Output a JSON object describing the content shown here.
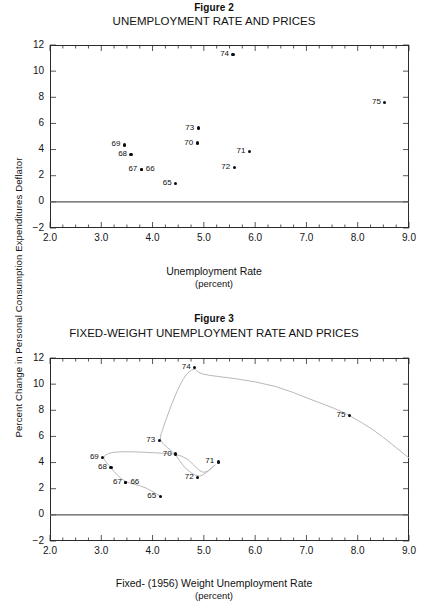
{
  "page": {
    "yaxis_shared_label": "Percent Change in  Personal Consumption  Expenditures Deflator"
  },
  "figure2": {
    "figure_label": "Figure 2",
    "title": "UNEMPLOYMENT  RATE  AND  PRICES",
    "xaxis_title": "Unemployment Rate",
    "xaxis_units": "(percent)",
    "ytick_labels": [
      "12",
      "10",
      "8",
      "6",
      "4",
      "2",
      "0",
      "−2"
    ],
    "xtick_labels": [
      "2.0",
      "3.0",
      "4.0",
      "5.0",
      "6.0",
      "7.0",
      "8.0",
      "9.0"
    ]
  },
  "figure3": {
    "figure_label": "Figure 3",
    "title": "FIXED-WEIGHT  UNEMPLOYMENT  RATE  AND  PRICES",
    "xaxis_title": "Fixed- (1956) Weight Unemployment Rate",
    "xaxis_units": "(percent)",
    "ytick_labels": [
      "12",
      "10",
      "8",
      "6",
      "4",
      "2",
      "0",
      "−2"
    ],
    "xtick_labels": [
      "2.0",
      "3.0",
      "4.0",
      "5.0",
      "6.0",
      "7.0",
      "8.0",
      "9.0"
    ]
  },
  "chart_data": [
    {
      "type": "scatter",
      "title": "UNEMPLOYMENT  RATE  AND  PRICES",
      "subtitle": "Figure 2",
      "xlabel": "Unemployment Rate (percent)",
      "ylabel": "Percent Change in Personal Consumption Expenditures Deflator",
      "xlim": [
        2.0,
        9.0
      ],
      "ylim": [
        -2,
        12
      ],
      "xticks": [
        2.0,
        3.0,
        4.0,
        5.0,
        6.0,
        7.0,
        8.0,
        9.0
      ],
      "yticks": [
        -2,
        0,
        2,
        4,
        6,
        8,
        10,
        12
      ],
      "grid": false,
      "legend": "none",
      "zero_line": true,
      "connected": false,
      "points": [
        {
          "label": "65",
          "label_side": "left",
          "x": 4.45,
          "y": 1.4
        },
        {
          "label": "66",
          "label_side": "right",
          "x": 3.78,
          "y": 2.5
        },
        {
          "label": "67",
          "label_side": "left",
          "x": 3.78,
          "y": 2.5
        },
        {
          "label": "68",
          "label_side": "left",
          "x": 3.58,
          "y": 3.6
        },
        {
          "label": "69",
          "label_side": "left",
          "x": 3.45,
          "y": 4.35
        },
        {
          "label": "70",
          "label_side": "left",
          "x": 4.87,
          "y": 4.5
        },
        {
          "label": "71",
          "label_side": "left",
          "x": 5.89,
          "y": 3.85
        },
        {
          "label": "72",
          "label_side": "left",
          "x": 5.59,
          "y": 2.6
        },
        {
          "label": "73",
          "label_side": "left",
          "x": 4.89,
          "y": 5.65
        },
        {
          "label": "74",
          "label_side": "left",
          "x": 5.57,
          "y": 11.3
        },
        {
          "label": "75",
          "label_side": "left",
          "x": 8.53,
          "y": 7.6
        }
      ]
    },
    {
      "type": "scatter",
      "title": "FIXED-WEIGHT  UNEMPLOYMENT  RATE  AND  PRICES",
      "subtitle": "Figure 3",
      "xlabel": "Fixed- (1956) Weight Unemployment Rate (percent)",
      "ylabel": "Percent Change in Personal Consumption Expenditures Deflator",
      "xlim": [
        2.0,
        9.0
      ],
      "ylim": [
        -2,
        12
      ],
      "xticks": [
        2.0,
        3.0,
        4.0,
        5.0,
        6.0,
        7.0,
        8.0,
        9.0
      ],
      "yticks": [
        -2,
        0,
        2,
        4,
        6,
        8,
        10,
        12
      ],
      "grid": false,
      "legend": "none",
      "zero_line": true,
      "connected": true,
      "points": [
        {
          "label": "65",
          "label_side": "left",
          "x": 4.15,
          "y": 1.4
        },
        {
          "label": "66",
          "label_side": "right",
          "x": 3.48,
          "y": 2.5
        },
        {
          "label": "67",
          "label_side": "left",
          "x": 3.48,
          "y": 2.5
        },
        {
          "label": "68",
          "label_side": "left",
          "x": 3.19,
          "y": 3.6
        },
        {
          "label": "69",
          "label_side": "left",
          "x": 3.03,
          "y": 4.4
        },
        {
          "label": "70",
          "label_side": "left",
          "x": 4.45,
          "y": 4.65
        },
        {
          "label": "71",
          "label_side": "left",
          "x": 5.28,
          "y": 4.05
        },
        {
          "label": "72",
          "label_side": "left",
          "x": 4.88,
          "y": 2.85
        },
        {
          "label": "73",
          "label_side": "left",
          "x": 4.13,
          "y": 5.7
        },
        {
          "label": "74",
          "label_side": "left",
          "x": 4.82,
          "y": 11.3
        },
        {
          "label": "75",
          "label_side": "left",
          "x": 7.84,
          "y": 7.6
        }
      ],
      "trace_path": [
        [
          4.15,
          1.4
        ],
        [
          3.9,
          2.05
        ],
        [
          3.62,
          2.38
        ],
        [
          3.48,
          2.5
        ],
        [
          3.3,
          3.05
        ],
        [
          3.19,
          3.6
        ],
        [
          3.09,
          4.05
        ],
        [
          3.03,
          4.4
        ],
        [
          3.12,
          4.72
        ],
        [
          3.38,
          4.85
        ],
        [
          3.8,
          4.8
        ],
        [
          4.25,
          4.7
        ],
        [
          4.45,
          4.65
        ],
        [
          4.7,
          4.3
        ],
        [
          4.9,
          3.35
        ],
        [
          5.05,
          3.2
        ],
        [
          5.28,
          4.05
        ],
        [
          5.05,
          3.2
        ],
        [
          4.88,
          2.85
        ],
        [
          4.6,
          3.65
        ],
        [
          4.45,
          4.65
        ],
        [
          4.3,
          5.1
        ],
        [
          4.13,
          5.7
        ],
        [
          4.18,
          6.35
        ],
        [
          4.35,
          8.3
        ],
        [
          4.6,
          10.55
        ],
        [
          4.82,
          11.3
        ],
        [
          4.9,
          10.75
        ],
        [
          5.6,
          10.45
        ],
        [
          6.4,
          9.9
        ],
        [
          7.1,
          8.8
        ],
        [
          7.55,
          8.15
        ],
        [
          7.84,
          7.6
        ],
        [
          8.3,
          6.55
        ],
        [
          8.7,
          5.3
        ],
        [
          9.0,
          4.35
        ]
      ]
    }
  ]
}
